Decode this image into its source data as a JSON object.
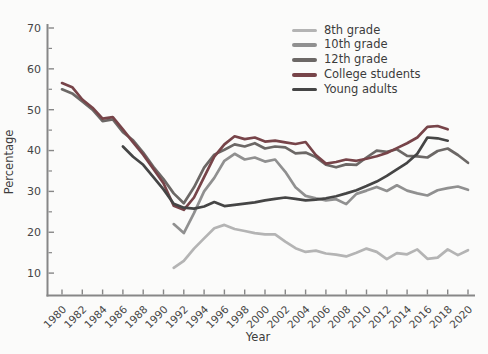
{
  "chart_data": {
    "type": "line",
    "title": "",
    "xlabel": "Year",
    "ylabel": "Percentage",
    "xlim": [
      1978.5,
      2020.7
    ],
    "ylim": [
      4,
      71
    ],
    "x_ticks": [
      1980,
      1982,
      1984,
      1986,
      1988,
      1990,
      1992,
      1994,
      1996,
      1998,
      2000,
      2002,
      2004,
      2006,
      2008,
      2010,
      2012,
      2014,
      2016,
      2018,
      2020
    ],
    "y_ticks": [
      10,
      20,
      30,
      40,
      50,
      60,
      70
    ],
    "y_minor_ticks": [
      15,
      25,
      35,
      45,
      55,
      65
    ],
    "grid": "off",
    "legend_position": "top-right-inside",
    "axis_color": "#878787",
    "tick_label_color": "#454545",
    "text_color": "#3c3c3c",
    "series": [
      {
        "name": "8th grade",
        "color": "#b4b4b4",
        "values": [
          [
            1991,
            11.3
          ],
          [
            1992,
            13.0
          ],
          [
            1993,
            16.0
          ],
          [
            1994,
            18.5
          ],
          [
            1995,
            21.0
          ],
          [
            1996,
            21.8
          ],
          [
            1997,
            20.8
          ],
          [
            1998,
            20.3
          ],
          [
            1999,
            19.8
          ],
          [
            2000,
            19.5
          ],
          [
            2001,
            19.5
          ],
          [
            2002,
            17.7
          ],
          [
            2003,
            16.1
          ],
          [
            2004,
            15.2
          ],
          [
            2005,
            15.5
          ],
          [
            2006,
            14.8
          ],
          [
            2007,
            14.5
          ],
          [
            2008,
            14.1
          ],
          [
            2009,
            15.0
          ],
          [
            2010,
            16.0
          ],
          [
            2011,
            15.2
          ],
          [
            2012,
            13.4
          ],
          [
            2013,
            14.9
          ],
          [
            2014,
            14.6
          ],
          [
            2015,
            15.8
          ],
          [
            2016,
            13.5
          ],
          [
            2017,
            13.8
          ],
          [
            2018,
            15.8
          ],
          [
            2019,
            14.4
          ],
          [
            2020,
            15.6
          ]
        ]
      },
      {
        "name": "10th grade",
        "color": "#909090",
        "values": [
          [
            1991,
            22.0
          ],
          [
            1992,
            19.8
          ],
          [
            1993,
            24.7
          ],
          [
            1994,
            30.0
          ],
          [
            1995,
            33.3
          ],
          [
            1996,
            37.5
          ],
          [
            1997,
            39.2
          ],
          [
            1998,
            37.8
          ],
          [
            1999,
            38.3
          ],
          [
            2000,
            37.3
          ],
          [
            2001,
            37.8
          ],
          [
            2002,
            34.8
          ],
          [
            2003,
            31.0
          ],
          [
            2004,
            28.9
          ],
          [
            2005,
            28.3
          ],
          [
            2006,
            27.8
          ],
          [
            2007,
            28.1
          ],
          [
            2008,
            26.9
          ],
          [
            2009,
            29.4
          ],
          [
            2010,
            30.2
          ],
          [
            2011,
            31.1
          ],
          [
            2012,
            30.1
          ],
          [
            2013,
            31.5
          ],
          [
            2014,
            30.2
          ],
          [
            2015,
            29.5
          ],
          [
            2016,
            29.0
          ],
          [
            2017,
            30.3
          ],
          [
            2018,
            30.8
          ],
          [
            2019,
            31.2
          ],
          [
            2020,
            30.4
          ]
        ]
      },
      {
        "name": "12th grade",
        "color": "#6c6866",
        "values": [
          [
            1980,
            55.0
          ],
          [
            1981,
            54.0
          ],
          [
            1982,
            52.0
          ],
          [
            1983,
            50.0
          ],
          [
            1984,
            47.2
          ],
          [
            1985,
            47.6
          ],
          [
            1986,
            44.5
          ],
          [
            1987,
            42.5
          ],
          [
            1988,
            39.5
          ],
          [
            1989,
            36.0
          ],
          [
            1990,
            33.0
          ],
          [
            1991,
            29.5
          ],
          [
            1992,
            27.1
          ],
          [
            1993,
            31.0
          ],
          [
            1994,
            35.8
          ],
          [
            1995,
            39.0
          ],
          [
            1996,
            40.2
          ],
          [
            1997,
            41.5
          ],
          [
            1998,
            41.0
          ],
          [
            1999,
            41.8
          ],
          [
            2000,
            40.5
          ],
          [
            2001,
            41.0
          ],
          [
            2002,
            40.8
          ],
          [
            2003,
            39.3
          ],
          [
            2004,
            39.5
          ],
          [
            2005,
            38.4
          ],
          [
            2006,
            36.5
          ],
          [
            2007,
            35.9
          ],
          [
            2008,
            36.6
          ],
          [
            2009,
            36.5
          ],
          [
            2010,
            38.3
          ],
          [
            2011,
            40.0
          ],
          [
            2012,
            39.7
          ],
          [
            2013,
            40.3
          ],
          [
            2014,
            38.7
          ],
          [
            2015,
            38.6
          ],
          [
            2016,
            38.3
          ],
          [
            2017,
            39.9
          ],
          [
            2018,
            40.5
          ],
          [
            2019,
            38.9
          ],
          [
            2020,
            37.0
          ]
        ]
      },
      {
        "name": "College students",
        "color": "#774449",
        "values": [
          [
            1980,
            56.5
          ],
          [
            1981,
            55.5
          ],
          [
            1982,
            52.5
          ],
          [
            1983,
            50.5
          ],
          [
            1984,
            47.8
          ],
          [
            1985,
            48.2
          ],
          [
            1986,
            45.2
          ],
          [
            1987,
            42.0
          ],
          [
            1988,
            39.0
          ],
          [
            1989,
            35.5
          ],
          [
            1990,
            32.0
          ],
          [
            1991,
            26.5
          ],
          [
            1992,
            25.5
          ],
          [
            1993,
            28.5
          ],
          [
            1994,
            33.5
          ],
          [
            1995,
            38.5
          ],
          [
            1996,
            41.5
          ],
          [
            1997,
            43.5
          ],
          [
            1998,
            42.8
          ],
          [
            1999,
            43.2
          ],
          [
            2000,
            42.2
          ],
          [
            2001,
            42.4
          ],
          [
            2002,
            42.0
          ],
          [
            2003,
            41.6
          ],
          [
            2004,
            42.1
          ],
          [
            2005,
            38.9
          ],
          [
            2006,
            36.8
          ],
          [
            2007,
            37.2
          ],
          [
            2008,
            37.8
          ],
          [
            2009,
            37.5
          ],
          [
            2010,
            38.0
          ],
          [
            2011,
            38.6
          ],
          [
            2012,
            39.4
          ],
          [
            2013,
            40.6
          ],
          [
            2014,
            41.8
          ],
          [
            2015,
            43.2
          ],
          [
            2016,
            45.8
          ],
          [
            2017,
            46.0
          ],
          [
            2018,
            45.2
          ]
        ]
      },
      {
        "name": "Young adults",
        "color": "#454545",
        "values": [
          [
            1986,
            41.0
          ],
          [
            1987,
            38.5
          ],
          [
            1988,
            36.5
          ],
          [
            1989,
            33.5
          ],
          [
            1990,
            30.5
          ],
          [
            1991,
            27.0
          ],
          [
            1992,
            26.0
          ],
          [
            1993,
            25.8
          ],
          [
            1994,
            26.3
          ],
          [
            1995,
            27.4
          ],
          [
            1996,
            26.4
          ],
          [
            1997,
            26.7
          ],
          [
            1998,
            27.0
          ],
          [
            1999,
            27.3
          ],
          [
            2000,
            27.8
          ],
          [
            2001,
            28.2
          ],
          [
            2002,
            28.5
          ],
          [
            2003,
            28.2
          ],
          [
            2004,
            27.8
          ],
          [
            2005,
            28.0
          ],
          [
            2006,
            28.3
          ],
          [
            2007,
            28.8
          ],
          [
            2008,
            29.5
          ],
          [
            2009,
            30.3
          ],
          [
            2010,
            31.3
          ],
          [
            2011,
            32.4
          ],
          [
            2012,
            33.8
          ],
          [
            2013,
            35.4
          ],
          [
            2014,
            37.0
          ],
          [
            2015,
            39.2
          ],
          [
            2016,
            43.2
          ],
          [
            2017,
            43.0
          ],
          [
            2018,
            42.4
          ]
        ]
      }
    ]
  }
}
